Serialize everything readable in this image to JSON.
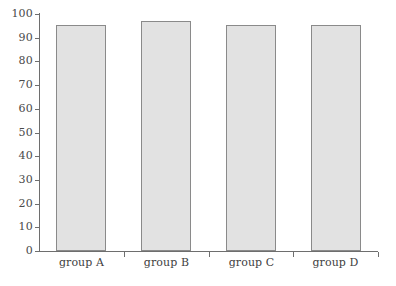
{
  "chart_data": {
    "type": "bar",
    "title": "",
    "subtitle": "",
    "xlabel": "",
    "ylabel": "",
    "categories": [
      "group A",
      "group B",
      "group C",
      "group D"
    ],
    "values": [
      95.5,
      97,
      95.5,
      95.3
    ],
    "series": [
      {
        "name": "",
        "values": [
          95.5,
          97,
          95.5,
          95.3
        ]
      }
    ],
    "ylim": [
      0,
      100
    ],
    "y_ticks": [
      0,
      10,
      20,
      30,
      40,
      50,
      60,
      70,
      80,
      90,
      100
    ],
    "y_tick_labels": [
      "0",
      "10",
      "20",
      "30",
      "40",
      "50",
      "60",
      "70",
      "80",
      "90",
      "100"
    ],
    "grid": false,
    "legend": false,
    "legend_position": "none",
    "annotations": [],
    "colors": {
      "bar_fill": "#e2e2e2",
      "bar_border": "#8a8a8a",
      "axis": "#6e6e6e",
      "tick_label": "#4a4a4a",
      "category_label": "#3f3f3f",
      "background": "#ffffff"
    }
  }
}
